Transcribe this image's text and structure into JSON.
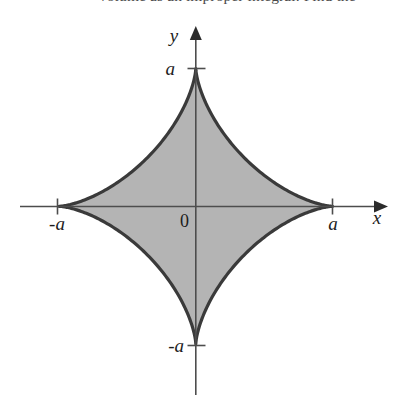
{
  "page": {
    "background_color": "#ffffff",
    "width": 398,
    "height": 401
  },
  "clipped_text": {
    "line": "volume as an improper integral. Find the"
  },
  "figure": {
    "caption": "astroid-region-plot",
    "axes": {
      "x_axis_label": "x",
      "y_axis_label": "y",
      "origin_label": "0",
      "axis_color": "#4d4d4d",
      "x_tick_labels": [
        "-a",
        "a"
      ],
      "y_tick_labels": [
        "a",
        "-a"
      ]
    },
    "region": {
      "name": "astroid",
      "equation": "x^(2/3) + y^(2/3) = a^(2/3)",
      "fill_color": "#b4b4b4",
      "stroke_color": "#3a3a3a",
      "stroke_width": 3.2
    }
  },
  "chart_data": {
    "type": "line",
    "title": "",
    "xlabel": "x",
    "ylabel": "y",
    "grid": false,
    "legend": null,
    "xlim": [
      -1.28,
      1.35
    ],
    "ylim": [
      -1.28,
      1.33
    ],
    "xticks": [
      -1,
      1
    ],
    "xticklabels": [
      "-a",
      "a"
    ],
    "yticks": [
      -1,
      1
    ],
    "yticklabels": [
      "-a",
      "a"
    ],
    "annotations": [
      {
        "text": "0",
        "x": -0.06,
        "y": -0.09
      },
      {
        "text": "x",
        "x": 1.32,
        "y": -0.1
      },
      {
        "text": "y",
        "x": -0.11,
        "y": 1.28
      }
    ],
    "series": [
      {
        "name": "astroid boundary",
        "parametric": true,
        "equation": "x = a*cos^3(t), y = a*sin^3(t)",
        "filled": true,
        "fill_color": "#b4b4b4",
        "line_color": "#3a3a3a",
        "points_xy": [
          [
            1.0,
            0.0
          ],
          [
            0.941,
            0.002
          ],
          [
            0.773,
            0.017
          ],
          [
            0.528,
            0.056
          ],
          [
            0.25,
            0.125
          ],
          [
            0.047,
            0.287
          ],
          [
            0.0,
            0.5
          ],
          [
            0.0,
            1.0
          ],
          [
            -0.047,
            0.287
          ],
          [
            -0.25,
            0.125
          ],
          [
            -0.528,
            0.056
          ],
          [
            -0.773,
            0.017
          ],
          [
            -0.941,
            0.002
          ],
          [
            -1.0,
            0.0
          ],
          [
            -0.941,
            -0.002
          ],
          [
            -0.773,
            -0.017
          ],
          [
            -0.528,
            -0.056
          ],
          [
            -0.25,
            -0.125
          ],
          [
            -0.047,
            -0.287
          ],
          [
            0.0,
            -1.0
          ],
          [
            0.047,
            -0.287
          ],
          [
            0.25,
            -0.125
          ],
          [
            0.528,
            -0.056
          ],
          [
            0.773,
            -0.017
          ],
          [
            0.941,
            -0.002
          ],
          [
            1.0,
            0.0
          ]
        ]
      }
    ]
  }
}
